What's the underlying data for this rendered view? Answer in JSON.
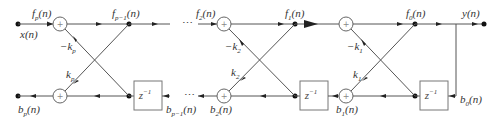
{
  "diagram": {
    "type": "lattice-filter",
    "input_label": "x(n)",
    "output_label": "y(n)",
    "ellipsis": "⋯",
    "delay_label": "z",
    "delay_exp": "−1",
    "adder_symbol": "+",
    "stages": [
      {
        "id": "p",
        "f_in": {
          "base": "f",
          "sub": "p",
          "arg": "(n)"
        },
        "f_out": {
          "base": "f",
          "sub": "p−1",
          "arg": "(n)"
        },
        "b_out": {
          "base": "b",
          "sub": "p",
          "arg": "(n)"
        },
        "b_in": {
          "base": "b",
          "sub": "p−1",
          "arg": "(n)"
        },
        "k_top": {
          "base": "−k",
          "sub": "p"
        },
        "k_bot": {
          "base": "k",
          "sub": "p"
        }
      },
      {
        "id": "2",
        "f_in": {
          "base": "f",
          "sub": "2",
          "arg": "(n)"
        },
        "f_out": {
          "base": "f",
          "sub": "1",
          "arg": "(n)"
        },
        "b_out": {
          "base": "b",
          "sub": "2",
          "arg": "(n)"
        },
        "b_in": {
          "base": "b",
          "sub": "1",
          "arg": "(n)"
        },
        "k_top": {
          "base": "−k",
          "sub": "2"
        },
        "k_bot": {
          "base": "k",
          "sub": "2"
        }
      },
      {
        "id": "1",
        "f_in": {
          "base": "f",
          "sub": "1",
          "arg": "(n)"
        },
        "f_out": {
          "base": "f",
          "sub": "0",
          "arg": "(n)"
        },
        "b_out": {
          "base": "b",
          "sub": "1",
          "arg": "(n)"
        },
        "b_in": {
          "base": "b",
          "sub": "0",
          "arg": "(n)"
        },
        "k_top": {
          "base": "−k",
          "sub": "1"
        },
        "k_bot": {
          "base": "k",
          "sub": "1"
        }
      }
    ]
  }
}
